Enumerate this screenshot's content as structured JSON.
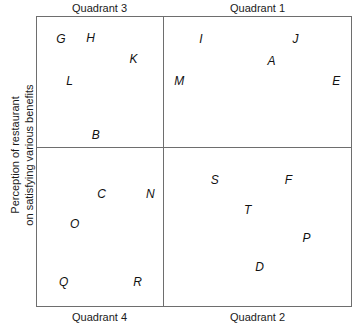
{
  "axes": {
    "y_title_line1": "Perception of restaurant",
    "y_title_line2": "on satisfying various benefits"
  },
  "headers": {
    "top_left": "Quadrant 3",
    "top_right": "Quadrant 1",
    "bottom_left": "Quadrant 4",
    "bottom_right": "Quadrant 2"
  },
  "chart_data": {
    "type": "scatter",
    "title": "",
    "xlabel": "",
    "ylabel": "Perception of restaurant on satisfying various benefits",
    "grid": false,
    "legend": "none",
    "quadrant_labels": {
      "top_left": "Quadrant 3",
      "top_right": "Quadrant 1",
      "bottom_left": "Quadrant 4",
      "bottom_right": "Quadrant 2"
    },
    "axis_divider_x_pct": 40,
    "axis_divider_y_pct": 45,
    "points": [
      {
        "label": "G",
        "quadrant": "Quadrant 3",
        "x_pct": 7.6,
        "y_pct": 7.6
      },
      {
        "label": "H",
        "quadrant": "Quadrant 3",
        "x_pct": 17.1,
        "y_pct": 7.2
      },
      {
        "label": "K",
        "quadrant": "Quadrant 3",
        "x_pct": 30.7,
        "y_pct": 14.4
      },
      {
        "label": "L",
        "quadrant": "Quadrant 3",
        "x_pct": 10.4,
        "y_pct": 22.3
      },
      {
        "label": "B",
        "quadrant": "Quadrant 3",
        "x_pct": 18.7,
        "y_pct": 40.9
      },
      {
        "label": "I",
        "quadrant": "Quadrant 1",
        "x_pct": 52.2,
        "y_pct": 7.6
      },
      {
        "label": "J",
        "quadrant": "Quadrant 1",
        "x_pct": 82.3,
        "y_pct": 7.6
      },
      {
        "label": "A",
        "quadrant": "Quadrant 1",
        "x_pct": 74.7,
        "y_pct": 15.1
      },
      {
        "label": "M",
        "quadrant": "Quadrant 1",
        "x_pct": 45.3,
        "y_pct": 22.3
      },
      {
        "label": "E",
        "quadrant": "Quadrant 1",
        "x_pct": 95.3,
        "y_pct": 22.3
      },
      {
        "label": "C",
        "quadrant": "Quadrant 4",
        "x_pct": 20.6,
        "y_pct": 61.2
      },
      {
        "label": "N",
        "quadrant": "Quadrant 4",
        "x_pct": 36.1,
        "y_pct": 61.2
      },
      {
        "label": "O",
        "quadrant": "Quadrant 4",
        "x_pct": 12.0,
        "y_pct": 71.5
      },
      {
        "label": "Q",
        "quadrant": "Quadrant 4",
        "x_pct": 8.5,
        "y_pct": 91.8
      },
      {
        "label": "R",
        "quadrant": "Quadrant 4",
        "x_pct": 32.0,
        "y_pct": 91.8
      },
      {
        "label": "S",
        "quadrant": "Quadrant 2",
        "x_pct": 56.6,
        "y_pct": 56.4
      },
      {
        "label": "F",
        "quadrant": "Quadrant 2",
        "x_pct": 80.1,
        "y_pct": 56.4
      },
      {
        "label": "T",
        "quadrant": "Quadrant 2",
        "x_pct": 67.1,
        "y_pct": 66.7
      },
      {
        "label": "P",
        "quadrant": "Quadrant 2",
        "x_pct": 85.8,
        "y_pct": 76.6
      },
      {
        "label": "D",
        "quadrant": "Quadrant 2",
        "x_pct": 70.9,
        "y_pct": 86.6
      }
    ]
  }
}
